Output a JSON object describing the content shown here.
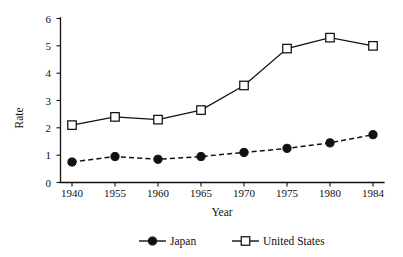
{
  "chart_data": {
    "type": "line",
    "title": "",
    "subtitle": "",
    "xlabel": "Year",
    "ylabel": "Rate",
    "categories": [
      "1940",
      "1955",
      "1960",
      "1965",
      "1970",
      "1975",
      "1980",
      "1984"
    ],
    "x": [
      1940,
      1955,
      1960,
      1965,
      1970,
      1975,
      1980,
      1984
    ],
    "series": [
      {
        "name": "Japan",
        "marker": "filled-circle",
        "linestyle": "dashed",
        "color": "#111111",
        "values": [
          0.75,
          0.95,
          0.85,
          0.95,
          1.1,
          1.25,
          1.45,
          1.75
        ]
      },
      {
        "name": "United States",
        "marker": "open-square",
        "linestyle": "solid",
        "color": "#111111",
        "values": [
          2.1,
          2.4,
          2.3,
          2.65,
          3.55,
          4.9,
          5.3,
          5.0
        ]
      }
    ],
    "ylim": [
      0,
      6
    ],
    "yticks": [
      0,
      1,
      2,
      3,
      4,
      5,
      6
    ],
    "ytick_labels": [
      "0",
      "1",
      "2",
      "3",
      "4",
      "5",
      "6"
    ],
    "xtick_labels": [
      "1940",
      "1955",
      "1960",
      "1965",
      "1970",
      "1975",
      "1980",
      "1984"
    ],
    "grid": false,
    "legend_position": "bottom-center",
    "spines": "left-bottom-only",
    "background": "#ffffff",
    "annotations": []
  },
  "legend": {
    "entries": [
      {
        "label": "Japan",
        "marker": "filled-circle",
        "linestyle": "dashed"
      },
      {
        "label": "United States",
        "marker": "open-square",
        "linestyle": "solid"
      }
    ]
  },
  "axes": {
    "y_title": "Rate",
    "x_title": "Year"
  }
}
